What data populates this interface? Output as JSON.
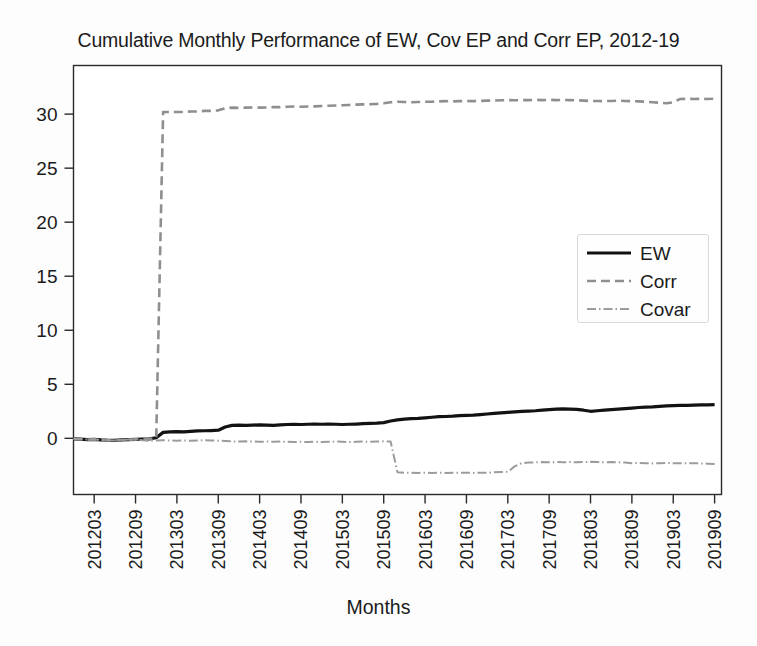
{
  "chart_data": {
    "type": "line",
    "title": "Cumulative Monthly Performance of EW, Cov EP and Corr EP, 2012-19",
    "xlabel": "Months",
    "ylabel": "",
    "grid": false,
    "legend_position": "center-right",
    "xlim": [
      0,
      94
    ],
    "ylim": [
      -5.2,
      34.5
    ],
    "yticks": [
      0,
      5,
      10,
      15,
      20,
      25,
      30
    ],
    "xticks": [
      "201203",
      "201209",
      "201303",
      "201309",
      "201403",
      "201409",
      "201503",
      "201509",
      "201603",
      "201609",
      "201703",
      "201709",
      "201803",
      "201809",
      "201903",
      "201909"
    ],
    "xtick_positions": [
      3,
      9,
      15,
      21,
      27,
      33,
      39,
      45,
      51,
      57,
      63,
      69,
      75,
      81,
      87,
      93
    ],
    "series": [
      {
        "name": "EW",
        "style": "solid",
        "color": "#121212",
        "x": [
          0,
          1,
          2,
          3,
          4,
          5,
          6,
          7,
          8,
          9,
          10,
          11,
          12,
          13,
          14,
          15,
          16,
          17,
          18,
          19,
          20,
          21,
          22,
          23,
          24,
          25,
          26,
          27,
          28,
          29,
          30,
          31,
          32,
          33,
          34,
          35,
          36,
          37,
          38,
          39,
          40,
          41,
          42,
          43,
          44,
          45,
          46,
          47,
          48,
          49,
          50,
          51,
          52,
          53,
          54,
          55,
          56,
          57,
          58,
          59,
          60,
          61,
          62,
          63,
          64,
          65,
          66,
          67,
          68,
          69,
          70,
          71,
          72,
          73,
          74,
          75,
          76,
          77,
          78,
          79,
          80,
          81,
          82,
          83,
          84,
          85,
          86,
          87,
          88,
          89,
          90,
          91,
          92,
          93
        ],
        "values": [
          -0.05,
          -0.08,
          -0.12,
          -0.1,
          -0.15,
          -0.18,
          -0.2,
          -0.15,
          -0.12,
          -0.1,
          -0.08,
          -0.05,
          0.05,
          0.55,
          0.6,
          0.62,
          0.6,
          0.65,
          0.68,
          0.7,
          0.72,
          0.75,
          1.05,
          1.2,
          1.22,
          1.2,
          1.22,
          1.25,
          1.22,
          1.2,
          1.25,
          1.28,
          1.3,
          1.28,
          1.3,
          1.32,
          1.3,
          1.32,
          1.3,
          1.28,
          1.3,
          1.32,
          1.35,
          1.38,
          1.4,
          1.45,
          1.6,
          1.7,
          1.78,
          1.82,
          1.85,
          1.9,
          1.95,
          2.0,
          2.02,
          2.05,
          2.1,
          2.12,
          2.15,
          2.2,
          2.25,
          2.3,
          2.35,
          2.4,
          2.45,
          2.5,
          2.52,
          2.55,
          2.6,
          2.65,
          2.7,
          2.72,
          2.7,
          2.68,
          2.6,
          2.5,
          2.55,
          2.6,
          2.65,
          2.7,
          2.75,
          2.8,
          2.85,
          2.88,
          2.9,
          2.95,
          3.0,
          3.02,
          3.05,
          3.05,
          3.08,
          3.1,
          3.1,
          3.12
        ]
      },
      {
        "name": "Corr",
        "style": "dashed",
        "color": "#8f8f8f",
        "x": [
          0,
          1,
          2,
          3,
          4,
          5,
          6,
          7,
          8,
          9,
          10,
          11,
          12,
          13,
          14,
          15,
          16,
          17,
          18,
          19,
          20,
          21,
          22,
          23,
          24,
          25,
          26,
          27,
          28,
          29,
          30,
          31,
          32,
          33,
          34,
          35,
          36,
          37,
          38,
          39,
          40,
          41,
          42,
          43,
          44,
          45,
          46,
          47,
          48,
          49,
          50,
          51,
          52,
          53,
          54,
          55,
          56,
          57,
          58,
          59,
          60,
          61,
          62,
          63,
          64,
          65,
          66,
          67,
          68,
          69,
          70,
          71,
          72,
          73,
          74,
          75,
          76,
          77,
          78,
          79,
          80,
          81,
          82,
          83,
          84,
          85,
          86,
          87,
          88,
          89,
          90,
          91,
          92,
          93
        ],
        "values": [
          -0.05,
          -0.08,
          -0.12,
          -0.1,
          -0.15,
          -0.18,
          -0.2,
          -0.15,
          -0.12,
          -0.1,
          -0.08,
          -0.05,
          0.0,
          30.2,
          30.2,
          30.2,
          30.2,
          30.25,
          30.25,
          30.3,
          30.3,
          30.35,
          30.55,
          30.6,
          30.58,
          30.6,
          30.62,
          30.6,
          30.62,
          30.65,
          30.65,
          30.68,
          30.7,
          30.68,
          30.7,
          30.72,
          30.75,
          30.78,
          30.8,
          30.82,
          30.85,
          30.88,
          30.9,
          30.92,
          30.95,
          31.0,
          31.1,
          31.15,
          31.12,
          31.1,
          31.12,
          31.15,
          31.15,
          31.18,
          31.2,
          31.18,
          31.2,
          31.22,
          31.2,
          31.22,
          31.25,
          31.25,
          31.28,
          31.3,
          31.28,
          31.3,
          31.3,
          31.32,
          31.3,
          31.32,
          31.3,
          31.32,
          31.3,
          31.28,
          31.25,
          31.22,
          31.22,
          31.2,
          31.22,
          31.25,
          31.22,
          31.2,
          31.18,
          31.15,
          31.1,
          31.05,
          31.0,
          31.1,
          31.4,
          31.42,
          31.4,
          31.42,
          31.4,
          31.42
        ]
      },
      {
        "name": "Covar",
        "style": "dashdot",
        "color": "#9c9c9c",
        "x": [
          0,
          1,
          2,
          3,
          4,
          5,
          6,
          7,
          8,
          9,
          10,
          11,
          12,
          13,
          14,
          15,
          16,
          17,
          18,
          19,
          20,
          21,
          22,
          23,
          24,
          25,
          26,
          27,
          28,
          29,
          30,
          31,
          32,
          33,
          34,
          35,
          36,
          37,
          38,
          39,
          40,
          41,
          42,
          43,
          44,
          45,
          46,
          47,
          48,
          49,
          50,
          51,
          52,
          53,
          54,
          55,
          56,
          57,
          58,
          59,
          60,
          61,
          62,
          63,
          64,
          65,
          66,
          67,
          68,
          69,
          70,
          71,
          72,
          73,
          74,
          75,
          76,
          77,
          78,
          79,
          80,
          81,
          82,
          83,
          84,
          85,
          86,
          87,
          88,
          89,
          90,
          91,
          92,
          93
        ],
        "values": [
          -0.05,
          -0.08,
          -0.12,
          -0.1,
          -0.15,
          -0.18,
          -0.2,
          -0.15,
          -0.12,
          -0.1,
          -0.18,
          -0.22,
          -0.2,
          -0.18,
          -0.2,
          -0.22,
          -0.2,
          -0.22,
          -0.2,
          -0.18,
          -0.2,
          -0.22,
          -0.25,
          -0.28,
          -0.3,
          -0.28,
          -0.3,
          -0.32,
          -0.3,
          -0.32,
          -0.3,
          -0.32,
          -0.35,
          -0.32,
          -0.35,
          -0.32,
          -0.35,
          -0.32,
          -0.3,
          -0.32,
          -0.35,
          -0.32,
          -0.3,
          -0.32,
          -0.3,
          -0.28,
          -0.3,
          -3.15,
          -3.2,
          -3.18,
          -3.2,
          -3.18,
          -3.2,
          -3.18,
          -3.2,
          -3.18,
          -3.2,
          -3.18,
          -3.2,
          -3.18,
          -3.2,
          -3.15,
          -3.12,
          -3.1,
          -2.6,
          -2.3,
          -2.25,
          -2.22,
          -2.2,
          -2.22,
          -2.2,
          -2.22,
          -2.2,
          -2.22,
          -2.2,
          -2.18,
          -2.2,
          -2.22,
          -2.2,
          -2.22,
          -2.25,
          -2.3,
          -2.28,
          -2.3,
          -2.32,
          -2.3,
          -2.28,
          -2.3,
          -2.3,
          -2.32,
          -2.3,
          -2.32,
          -2.35,
          -2.38
        ]
      }
    ]
  },
  "legend": {
    "items": [
      {
        "label": "EW",
        "style": "solid",
        "color": "#121212"
      },
      {
        "label": "Corr",
        "style": "dashed",
        "color": "#8f8f8f"
      },
      {
        "label": "Covar",
        "style": "dashdot",
        "color": "#9c9c9c"
      }
    ]
  }
}
